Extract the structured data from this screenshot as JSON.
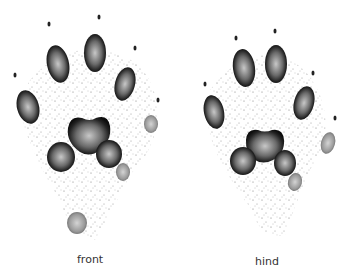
{
  "figure": {
    "labels": {
      "front": "front",
      "hind": "hind"
    },
    "colors": {
      "pad_dark": "#1a1a1a",
      "pad_light": "#9a9a9a",
      "stipple": "#555555",
      "background": "#ffffff"
    }
  }
}
